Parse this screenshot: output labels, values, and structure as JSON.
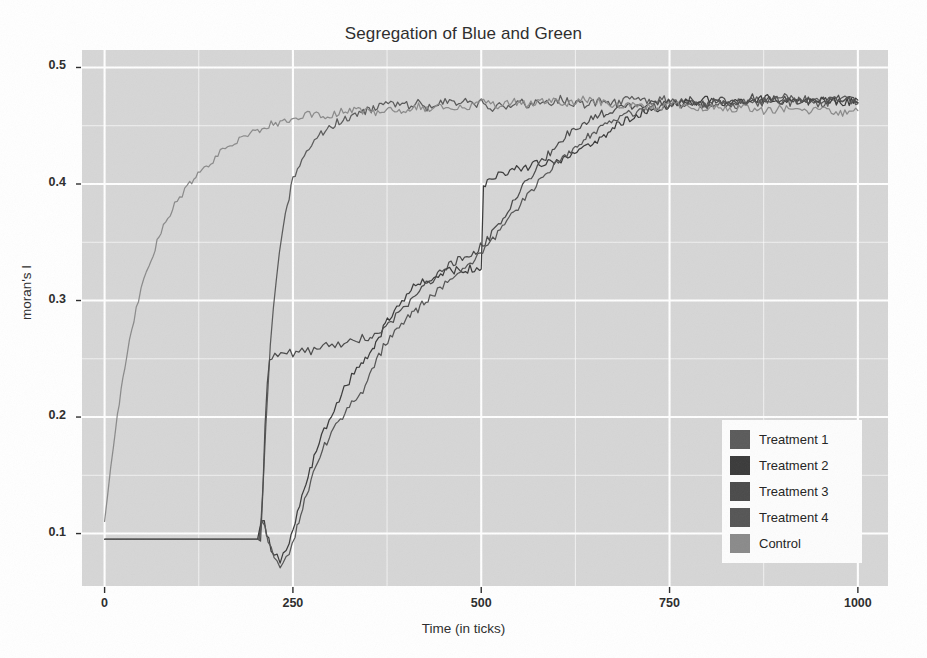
{
  "chart_data": {
    "type": "line",
    "title": "Segregation of Blue and Green",
    "xlabel": "Time (in ticks)",
    "ylabel": "moran's I",
    "xlim": [
      -30,
      1040
    ],
    "ylim": [
      0.055,
      0.515
    ],
    "xticks": [
      0,
      250,
      500,
      750,
      1000
    ],
    "xtick_labels": [
      "0",
      "250",
      "500",
      "750",
      "1000"
    ],
    "yticks": [
      0.1,
      0.2,
      0.3,
      0.4,
      0.5
    ],
    "ytick_labels": [
      "0.1",
      "0.2",
      "0.3",
      "0.4",
      "0.5"
    ],
    "minor_yticks": [
      0.15,
      0.25,
      0.35,
      0.45
    ],
    "minor_xticks": [
      125,
      375,
      625,
      875
    ],
    "grid": true,
    "grid_color": "#ffffff",
    "panel_background": "#d6d6d6",
    "legend_position": "bottom-right",
    "series": [
      {
        "name": "Treatment 1",
        "color": "#5a5a5a",
        "x": [
          0,
          205,
          208,
          211,
          214,
          217,
          220,
          224,
          228,
          232,
          236,
          240,
          245,
          250,
          256,
          262,
          268,
          275,
          282,
          290,
          298,
          306,
          314,
          322,
          330,
          338,
          346,
          354,
          362,
          370,
          380,
          392,
          404,
          416,
          428,
          440,
          452,
          464,
          476,
          488,
          500,
          512,
          524,
          536,
          548,
          560,
          575,
          590,
          605,
          620,
          640,
          660,
          680,
          700,
          720,
          740,
          760,
          780,
          800,
          820,
          840,
          860,
          880,
          900,
          920,
          940,
          960,
          980,
          1000
        ],
        "y": [
          0.095,
          0.095,
          0.112,
          0.148,
          0.19,
          0.228,
          0.262,
          0.292,
          0.318,
          0.34,
          0.358,
          0.374,
          0.39,
          0.403,
          0.414,
          0.423,
          0.43,
          0.436,
          0.441,
          0.445,
          0.449,
          0.452,
          0.455,
          0.457,
          0.459,
          0.461,
          0.462,
          0.464,
          0.466,
          0.468,
          0.47,
          0.469,
          0.467,
          0.47,
          0.466,
          0.468,
          0.471,
          0.469,
          0.472,
          0.467,
          0.47,
          0.465,
          0.468,
          0.466,
          0.471,
          0.468,
          0.472,
          0.469,
          0.473,
          0.47,
          0.467,
          0.472,
          0.469,
          0.474,
          0.47,
          0.473,
          0.469,
          0.472,
          0.467,
          0.471,
          0.468,
          0.473,
          0.47,
          0.475,
          0.471,
          0.474,
          0.47,
          0.473,
          0.47
        ]
      },
      {
        "name": "Treatment 2",
        "color": "#3a3a3a",
        "x": [
          0,
          203,
          206,
          209,
          212,
          215,
          218,
          221,
          225,
          229,
          233,
          237,
          241,
          245,
          250,
          256,
          262,
          270,
          278,
          288,
          298,
          308,
          318,
          328,
          338,
          346,
          352,
          356,
          358,
          360,
          364,
          370,
          378,
          388,
          398,
          410,
          422,
          434,
          446,
          458,
          470,
          482,
          494,
          498,
          500,
          503,
          508,
          516,
          526,
          538,
          550,
          562,
          574,
          586,
          600,
          615,
          630,
          645,
          660,
          680,
          700,
          720,
          740,
          760,
          780,
          800,
          820,
          840,
          860,
          880,
          900,
          920,
          940,
          960,
          980,
          1000
        ],
        "y": [
          0.095,
          0.095,
          0.104,
          0.11,
          0.108,
          0.1,
          0.093,
          0.086,
          0.082,
          0.079,
          0.078,
          0.08,
          0.085,
          0.093,
          0.104,
          0.117,
          0.131,
          0.148,
          0.164,
          0.182,
          0.198,
          0.212,
          0.224,
          0.234,
          0.243,
          0.25,
          0.254,
          0.256,
          0.258,
          0.262,
          0.268,
          0.276,
          0.285,
          0.295,
          0.303,
          0.311,
          0.316,
          0.32,
          0.323,
          0.325,
          0.326,
          0.327,
          0.328,
          0.329,
          0.33,
          0.398,
          0.404,
          0.406,
          0.409,
          0.411,
          0.414,
          0.415,
          0.418,
          0.417,
          0.42,
          0.423,
          0.427,
          0.433,
          0.44,
          0.45,
          0.458,
          0.463,
          0.466,
          0.468,
          0.47,
          0.472,
          0.469,
          0.473,
          0.47,
          0.474,
          0.471,
          0.474,
          0.47,
          0.473,
          0.469,
          0.472
        ]
      },
      {
        "name": "Treatment 3",
        "color": "#4a4a4a",
        "x": [
          0,
          207,
          210,
          213,
          216,
          219,
          222,
          226,
          230,
          234,
          238,
          242,
          246,
          250,
          254,
          258,
          262,
          266,
          270,
          274,
          278,
          282,
          286,
          290,
          294,
          298,
          302,
          306,
          310,
          314,
          318,
          322,
          326,
          330,
          334,
          338,
          342,
          346,
          350,
          355,
          362,
          370,
          380,
          390,
          400,
          412,
          424,
          436,
          448,
          460,
          472,
          484,
          496,
          508,
          520,
          532,
          545,
          558,
          572,
          586,
          600,
          620,
          640,
          660,
          680,
          700,
          720,
          740,
          760,
          780,
          800,
          820,
          840,
          860,
          880,
          900,
          920,
          940,
          960,
          980,
          1000
        ],
        "y": [
          0.095,
          0.095,
          0.135,
          0.192,
          0.228,
          0.247,
          0.253,
          0.255,
          0.254,
          0.256,
          0.255,
          0.253,
          0.256,
          0.254,
          0.257,
          0.255,
          0.258,
          0.256,
          0.259,
          0.257,
          0.26,
          0.258,
          0.261,
          0.259,
          0.262,
          0.26,
          0.263,
          0.261,
          0.264,
          0.262,
          0.265,
          0.263,
          0.266,
          0.264,
          0.267,
          0.265,
          0.268,
          0.266,
          0.268,
          0.27,
          0.272,
          0.276,
          0.282,
          0.289,
          0.296,
          0.304,
          0.312,
          0.319,
          0.325,
          0.331,
          0.336,
          0.34,
          0.344,
          0.352,
          0.362,
          0.374,
          0.388,
          0.4,
          0.412,
          0.423,
          0.434,
          0.446,
          0.454,
          0.46,
          0.464,
          0.467,
          0.469,
          0.471,
          0.468,
          0.472,
          0.469,
          0.473,
          0.47,
          0.474,
          0.471,
          0.474,
          0.47,
          0.473,
          0.471,
          0.474,
          0.47
        ]
      },
      {
        "name": "Treatment 4",
        "color": "#555555",
        "x": [
          0,
          205,
          209,
          213,
          217,
          221,
          225,
          229,
          233,
          237,
          241,
          245,
          249,
          253,
          258,
          263,
          268,
          274,
          280,
          286,
          292,
          298,
          304,
          310,
          316,
          322,
          328,
          334,
          340,
          346,
          352,
          358,
          364,
          370,
          376,
          382,
          388,
          394,
          400,
          408,
          416,
          424,
          432,
          442,
          452,
          462,
          472,
          482,
          492,
          502,
          512,
          522,
          534,
          546,
          558,
          570,
          582,
          594,
          608,
          622,
          636,
          650,
          670,
          690,
          710,
          730,
          750,
          770,
          790,
          810,
          830,
          850,
          870,
          890,
          910,
          930,
          950,
          970,
          1000
        ],
        "y": [
          0.095,
          0.095,
          0.108,
          0.104,
          0.096,
          0.088,
          0.08,
          0.075,
          0.073,
          0.074,
          0.077,
          0.082,
          0.09,
          0.099,
          0.11,
          0.122,
          0.134,
          0.146,
          0.157,
          0.167,
          0.175,
          0.183,
          0.19,
          0.196,
          0.201,
          0.206,
          0.211,
          0.215,
          0.22,
          0.226,
          0.234,
          0.243,
          0.252,
          0.26,
          0.266,
          0.271,
          0.275,
          0.279,
          0.283,
          0.288,
          0.293,
          0.298,
          0.303,
          0.309,
          0.315,
          0.32,
          0.326,
          0.331,
          0.337,
          0.343,
          0.35,
          0.358,
          0.368,
          0.378,
          0.388,
          0.397,
          0.405,
          0.413,
          0.422,
          0.43,
          0.438,
          0.445,
          0.453,
          0.459,
          0.463,
          0.466,
          0.468,
          0.47,
          0.467,
          0.471,
          0.468,
          0.472,
          0.469,
          0.473,
          0.47,
          0.473,
          0.469,
          0.472,
          0.469
        ]
      },
      {
        "name": "Control",
        "color": "#8a8a8a",
        "x": [
          0,
          4,
          8,
          12,
          17,
          22,
          27,
          33,
          39,
          45,
          52,
          59,
          67,
          75,
          84,
          93,
          103,
          113,
          124,
          135,
          147,
          160,
          173,
          187,
          200,
          215,
          230,
          245,
          260,
          278,
          296,
          314,
          334,
          354,
          374,
          394,
          414,
          434,
          456,
          478,
          500,
          522,
          544,
          566,
          590,
          614,
          638,
          662,
          686,
          710,
          734,
          758,
          782,
          806,
          830,
          854,
          878,
          902,
          926,
          950,
          974,
          1000
        ],
        "y": [
          0.11,
          0.132,
          0.155,
          0.178,
          0.202,
          0.224,
          0.245,
          0.265,
          0.283,
          0.3,
          0.316,
          0.331,
          0.345,
          0.358,
          0.37,
          0.381,
          0.391,
          0.4,
          0.408,
          0.416,
          0.423,
          0.43,
          0.436,
          0.441,
          0.446,
          0.45,
          0.453,
          0.456,
          0.459,
          0.461,
          0.458,
          0.462,
          0.464,
          0.461,
          0.465,
          0.463,
          0.467,
          0.464,
          0.468,
          0.466,
          0.47,
          0.467,
          0.471,
          0.468,
          0.472,
          0.469,
          0.473,
          0.47,
          0.466,
          0.469,
          0.465,
          0.468,
          0.464,
          0.467,
          0.463,
          0.466,
          0.462,
          0.465,
          0.461,
          0.464,
          0.46,
          0.463
        ]
      }
    ]
  },
  "legend": {
    "items": [
      {
        "label": "Treatment 1",
        "color": "#5a5a5a"
      },
      {
        "label": "Treatment 2",
        "color": "#3a3a3a"
      },
      {
        "label": "Treatment 3",
        "color": "#4a4a4a"
      },
      {
        "label": "Treatment 4",
        "color": "#555555"
      },
      {
        "label": "Control",
        "color": "#8a8a8a"
      }
    ]
  }
}
